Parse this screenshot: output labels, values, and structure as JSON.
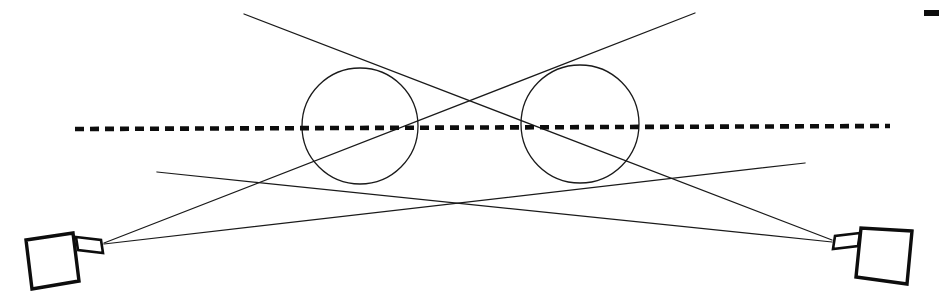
{
  "figure": {
    "background_color": "#ffffff",
    "line_color": "#1a1a1a",
    "axis_color": "#0d0d0d",
    "width": 939,
    "height": 308
  },
  "chart_data": {
    "type": "scatter",
    "xlabel": "",
    "ylabel": "",
    "xlim": [
      0,
      939
    ],
    "ylim": [
      308,
      0
    ],
    "grid": false,
    "legend": "none",
    "annotations": [],
    "series": [
      {
        "name": "optical-axis",
        "kind": "dashed-line",
        "x": [
          75,
          890
        ],
        "y": [
          129,
          126
        ]
      },
      {
        "name": "left-camera-upper-ray",
        "kind": "line",
        "x": [
          104,
          695
        ],
        "y": [
          243,
          13
        ]
      },
      {
        "name": "right-camera-upper-ray",
        "kind": "line",
        "x": [
          832,
          244
        ],
        "y": [
          240,
          14
        ]
      },
      {
        "name": "left-camera-lower-ray",
        "kind": "line",
        "x": [
          104,
          805
        ],
        "y": [
          244,
          163
        ]
      },
      {
        "name": "right-camera-lower-ray",
        "kind": "line",
        "x": [
          832,
          157
        ],
        "y": [
          242,
          172
        ]
      }
    ],
    "circles": [
      {
        "name": "left-lens-circle",
        "cx": 360,
        "cy": 126,
        "r": 58
      },
      {
        "name": "right-lens-circle",
        "cx": 580,
        "cy": 124,
        "r": 59
      }
    ],
    "crossings": [
      {
        "name": "upper-crossing",
        "x": 470,
        "y": 103
      },
      {
        "name": "lower-crossing",
        "x": 470,
        "y": 206
      }
    ]
  },
  "elements": {
    "left_camera": {
      "name": "Left camera",
      "body_points": "26,240 73,233 79,281 32,289",
      "lens_points": "76,237 101,240 103,253 78,250",
      "emit_x": 104,
      "emit_y": 243
    },
    "right_camera": {
      "name": "Right camera",
      "body_points": "912,231 861,228 856,277 907,284",
      "lens_points": "860,233 835,236 833,249 858,246",
      "emit_x": 832,
      "emit_y": 241
    },
    "left_lens_circle": {
      "name": "Left lens element",
      "cx": 360,
      "cy": 126,
      "r": 58
    },
    "right_lens_circle": {
      "name": "Right lens element",
      "cx": 580,
      "cy": 124,
      "r": 59
    },
    "optical_axis": {
      "name": "Optical axis",
      "x1": 75,
      "y1": 129,
      "x2": 890,
      "y2": 126
    },
    "corner_mark": {
      "name": "Corner registration mark",
      "x": 924,
      "y": 10,
      "width": 15,
      "height": 6
    },
    "rays": [
      {
        "name": "ray-left-to-upper-right",
        "x1": 104,
        "y1": 243,
        "x2": 695,
        "y2": 13
      },
      {
        "name": "ray-right-to-upper-left",
        "x1": 832,
        "y1": 240,
        "x2": 244,
        "y2": 14
      },
      {
        "name": "ray-left-to-lower-right",
        "x1": 104,
        "y1": 244,
        "x2": 805,
        "y2": 163
      },
      {
        "name": "ray-right-to-lower-left",
        "x1": 832,
        "y1": 242,
        "x2": 157,
        "y2": 172
      }
    ]
  }
}
